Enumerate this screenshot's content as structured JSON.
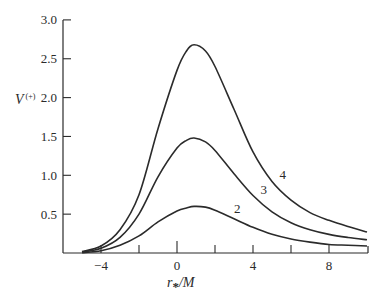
{
  "chart_data": {
    "type": "line",
    "title": "",
    "xlabel": "r*/M",
    "xlabel_main": "r",
    "xlabel_sub": "*",
    "xlabel_tail": "/M",
    "ylabel": "V(+)",
    "ylabel_main": "V",
    "ylabel_sup": "(+)",
    "xlim": [
      -5,
      10
    ],
    "ylim": [
      0,
      3.0
    ],
    "grid": false,
    "legend": "inline curve labels",
    "x_ticks": [
      -4,
      -2,
      0,
      2,
      4,
      6,
      8,
      10
    ],
    "x_tick_labels": [
      "-4",
      "",
      "0",
      "",
      "4",
      "",
      "8",
      ""
    ],
    "y_ticks": [
      0.5,
      1.0,
      1.5,
      2.0,
      2.5,
      3.0
    ],
    "y_tick_labels": [
      "0.5",
      "1.0",
      "1.5",
      "2.0",
      "2.5",
      "3.0"
    ],
    "x": [
      -5,
      -4,
      -3,
      -2,
      -1,
      0,
      0.5,
      0.9,
      1.5,
      2,
      3,
      4,
      5,
      6,
      7,
      8,
      9,
      10
    ],
    "series": [
      {
        "name": "4",
        "label": "4",
        "values": [
          0.02,
          0.09,
          0.3,
          0.75,
          1.6,
          2.35,
          2.6,
          2.68,
          2.6,
          2.4,
          1.85,
          1.3,
          0.92,
          0.68,
          0.52,
          0.42,
          0.34,
          0.27
        ]
      },
      {
        "name": "3",
        "label": "3",
        "values": [
          0.01,
          0.06,
          0.2,
          0.5,
          0.98,
          1.35,
          1.45,
          1.48,
          1.43,
          1.32,
          1.02,
          0.74,
          0.53,
          0.39,
          0.3,
          0.24,
          0.2,
          0.17
        ]
      },
      {
        "name": "2",
        "label": "2",
        "values": [
          0.005,
          0.03,
          0.1,
          0.22,
          0.4,
          0.54,
          0.58,
          0.6,
          0.59,
          0.55,
          0.44,
          0.33,
          0.24,
          0.18,
          0.14,
          0.11,
          0.1,
          0.09
        ]
      }
    ],
    "curve_label_positions": [
      {
        "label": "4",
        "x": 5.4,
        "y": 0.95
      },
      {
        "label": "3",
        "x": 4.4,
        "y": 0.76
      },
      {
        "label": "2",
        "x": 3.0,
        "y": 0.52
      }
    ]
  }
}
